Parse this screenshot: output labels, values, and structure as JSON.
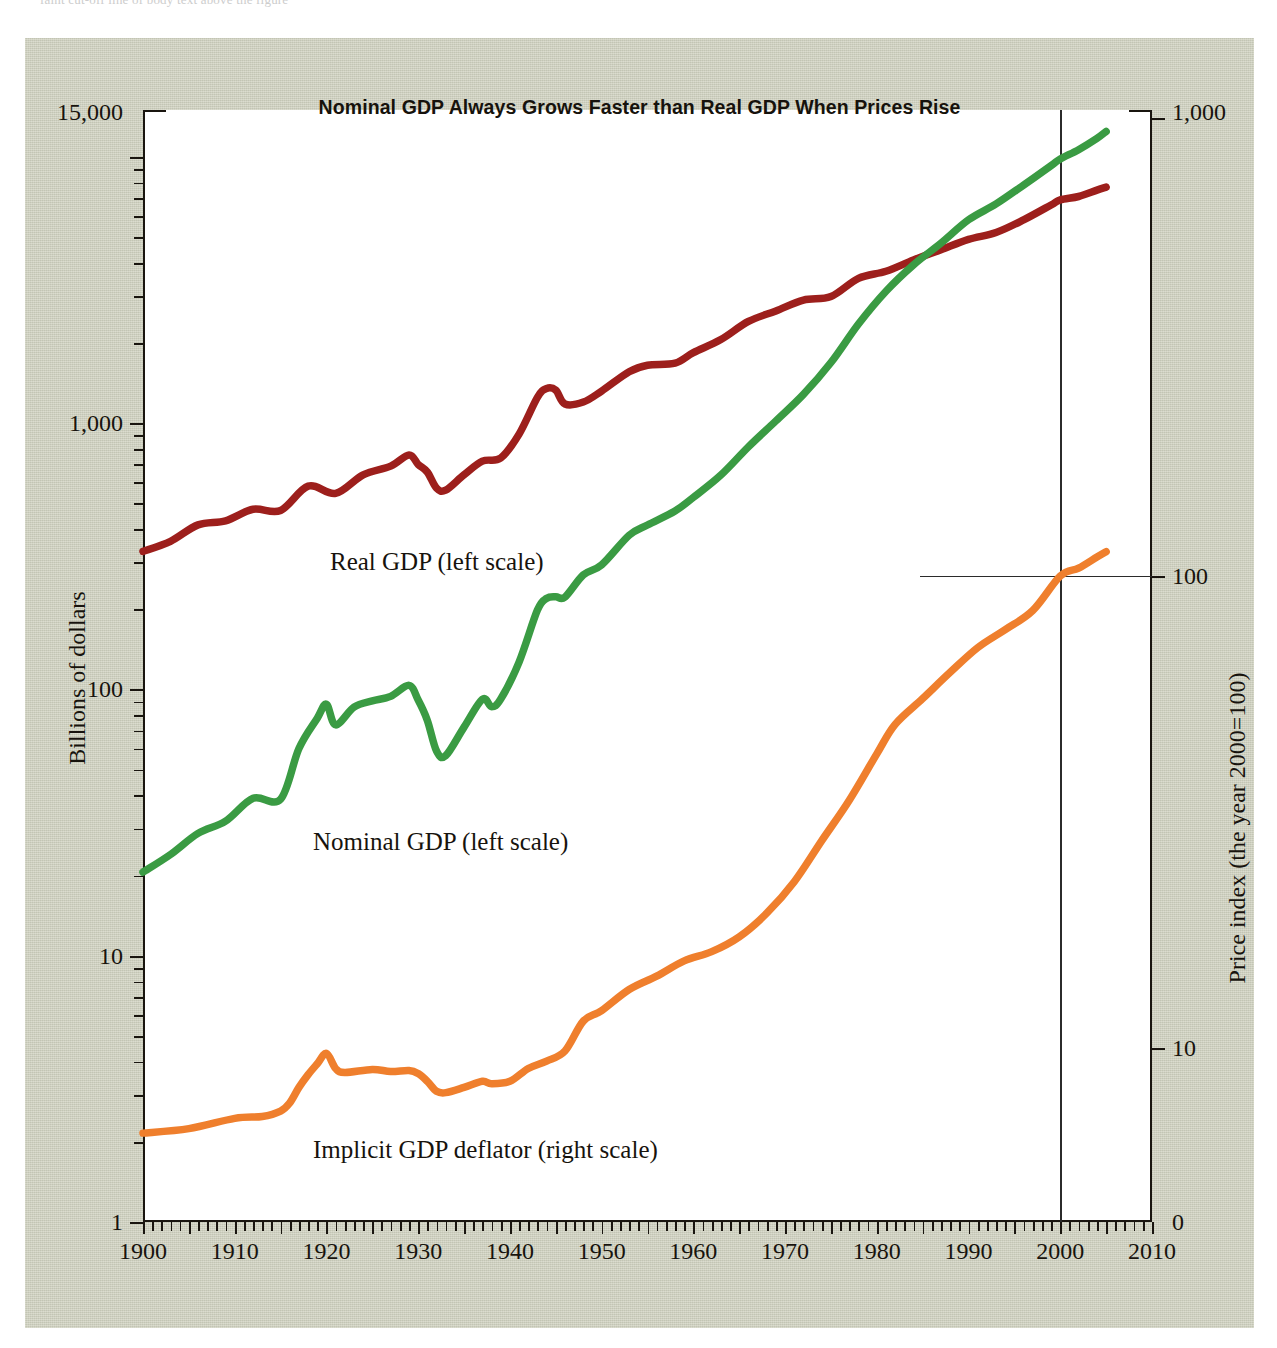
{
  "top_strip_text": "          faint cut-off line of body text above the figure",
  "chart_data": {
    "type": "line",
    "title": "Nominal GDP Always Grows Faster than Real GDP When Prices Rise",
    "xlabel": "",
    "ylabel": "Billions of dollars",
    "ylabel_right": "Price index (the year 2000=100)",
    "xlim": [
      1900,
      2010
    ],
    "ylim_left": [
      1,
      15000
    ],
    "ylim_right": [
      0,
      1000
    ],
    "yscale": "log",
    "grid": false,
    "legend": "inline-annotations",
    "x_ticks": [
      "1900",
      "1910",
      "1920",
      "1930",
      "1940",
      "1950",
      "1960",
      "1970",
      "1980",
      "1990",
      "2000",
      "2010"
    ],
    "x_tick_values": [
      1900,
      1910,
      1920,
      1930,
      1940,
      1950,
      1960,
      1970,
      1980,
      1990,
      2000,
      2010
    ],
    "y_ticks_left": [
      "15,000",
      "1,000",
      "100",
      "10",
      "1"
    ],
    "y_tick_values_left": [
      15000,
      1000,
      100,
      10,
      1
    ],
    "y_ticks_right": [
      "1,000",
      "100",
      "10",
      "0"
    ],
    "y_tick_values_right": [
      1000,
      100,
      10,
      0
    ],
    "reference_lines": [
      {
        "type": "vertical",
        "x": 2000,
        "label": "year 2000"
      },
      {
        "type": "horizontal",
        "y_right": 100,
        "label": "index = 100"
      }
    ],
    "series": [
      {
        "name": "Real GDP (left scale)",
        "label": "Real GDP (left scale)",
        "color": "#9d1f1c",
        "axis": "left",
        "units": "Billions of dollars",
        "x": [
          1900,
          1903,
          1906,
          1909,
          1912,
          1915,
          1918,
          1921,
          1924,
          1927,
          1929,
          1930,
          1931,
          1932,
          1933,
          1935,
          1937,
          1939,
          1941,
          1943,
          1944,
          1945,
          1946,
          1948,
          1950,
          1953,
          1955,
          1958,
          1960,
          1963,
          1966,
          1969,
          1972,
          1975,
          1978,
          1981,
          1984,
          1987,
          1990,
          1993,
          1996,
          1999,
          2000,
          2002,
          2004,
          2005
        ],
        "y": [
          330,
          360,
          415,
          430,
          475,
          470,
          580,
          545,
          640,
          690,
          760,
          700,
          655,
          570,
          560,
          640,
          720,
          740,
          910,
          1250,
          1350,
          1330,
          1180,
          1200,
          1320,
          1560,
          1650,
          1680,
          1840,
          2060,
          2410,
          2640,
          2900,
          2990,
          3500,
          3720,
          4100,
          4480,
          4900,
          5200,
          5800,
          6600,
          6900,
          7100,
          7500,
          7700
        ]
      },
      {
        "name": "Nominal GDP (left scale)",
        "label": "Nominal GDP (left scale)",
        "color": "#3a9b43",
        "axis": "left",
        "units": "Billions of dollars",
        "x": [
          1900,
          1903,
          1906,
          1909,
          1912,
          1915,
          1917,
          1919,
          1920,
          1921,
          1923,
          1925,
          1927,
          1929,
          1930,
          1931,
          1932,
          1933,
          1935,
          1937,
          1938,
          1939,
          1941,
          1943,
          1944,
          1945,
          1946,
          1948,
          1950,
          1953,
          1955,
          1958,
          1960,
          1963,
          1966,
          1969,
          1972,
          1975,
          1978,
          1981,
          1984,
          1987,
          1990,
          1993,
          1996,
          1999,
          2000,
          2002,
          2004,
          2005
        ],
        "y": [
          20.6,
          24,
          28.8,
          32,
          39,
          38.7,
          60,
          78,
          88,
          73.6,
          85.8,
          90.6,
          94.2,
          103.6,
          91.2,
          76.5,
          58.7,
          56.4,
          72.2,
          91.9,
          86.1,
          92,
          126.7,
          198.6,
          219.8,
          223,
          222.2,
          269.2,
          293.7,
          379.3,
          414.7,
          468.1,
          526.4,
          638.6,
          815,
          1019.9,
          1282.4,
          1688.9,
          2356.6,
          3128.4,
          3930.9,
          4742.5,
          5803.1,
          6657.4,
          7838.5,
          9268.4,
          9817,
          10642,
          11735,
          12456
        ]
      },
      {
        "name": "Implicit GDP deflator (right scale)",
        "label": "Implicit GDP deflator (right scale)",
        "color": "#ef7f2d",
        "axis": "right",
        "units": "Price index (the year 2000=100)",
        "x": [
          1900,
          1905,
          1910,
          1913,
          1915,
          1916,
          1917,
          1918,
          1919,
          1920,
          1921,
          1922,
          1925,
          1927,
          1929,
          1930,
          1931,
          1932,
          1933,
          1935,
          1937,
          1938,
          1940,
          1942,
          1944,
          1946,
          1948,
          1950,
          1953,
          1956,
          1959,
          1962,
          1965,
          1968,
          1971,
          1974,
          1977,
          1980,
          1982,
          1985,
          1988,
          1991,
          1994,
          1997,
          2000,
          2002,
          2004,
          2005
        ],
        "y": [
          3.2,
          3.4,
          3.9,
          4.0,
          4.3,
          4.8,
          5.9,
          7.0,
          8.1,
          9.3,
          7.6,
          7.2,
          7.5,
          7.3,
          7.4,
          7.1,
          6.4,
          5.6,
          5.5,
          5.9,
          6.4,
          6.2,
          6.4,
          7.6,
          8.4,
          9.6,
          11.4,
          12.0,
          13.3,
          14.2,
          15.3,
          16.0,
          17.2,
          19.3,
          22.5,
          27.5,
          33.5,
          42.0,
          48.5,
          55.0,
          62.5,
          70.5,
          77.0,
          84.5,
          100.0,
          104.0,
          110.0,
          113.0
        ]
      }
    ]
  },
  "series_annotations": [
    {
      "key": "real-gdp",
      "text": "Real GDP (left scale)",
      "left": 305,
      "top": 510
    },
    {
      "key": "nominal-gdp",
      "text": "Nominal GDP (left scale)",
      "left": 288,
      "top": 790
    },
    {
      "key": "deflator",
      "text": "Implicit GDP deflator (right scale)",
      "left": 288,
      "top": 1098
    }
  ],
  "colors": {
    "panel": "#cfd1bf",
    "plot_background": "#ffffff",
    "axis": "#19150f",
    "real_gdp": "#9d1f1c",
    "nominal_gdp": "#3a9b43",
    "deflator": "#ef7f2d"
  }
}
